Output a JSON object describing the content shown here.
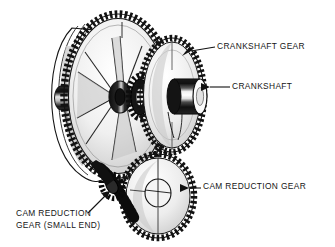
{
  "figure": {
    "style": "black-and-white line art / halftone technical illustration",
    "background_color": "#ffffff",
    "ink_color": "#111111"
  },
  "labels": {
    "crankshaft_gear": "CRANKSHAFT GEAR",
    "crankshaft": "CRANKSHAFT",
    "cam_reduction_gear": "CAM REDUCTION GEAR",
    "cam_reduction_gear_small_end_line1": "CAM REDUCTION",
    "cam_reduction_gear_small_end_line2": "GEAR (SMALL END)"
  },
  "parts": [
    {
      "name": "large-drive-gear",
      "description": "large spoked gear at left, toothed rim"
    },
    {
      "name": "crankshaft-gear",
      "description": "toothed gear at upper right of the drive gear"
    },
    {
      "name": "crankshaft",
      "description": "cylindrical shaft protruding from the crankshaft gear"
    },
    {
      "name": "cam-reduction-gear",
      "description": "large toothed gear at lower right"
    },
    {
      "name": "cam-reduction-gear-small-end",
      "description": "small dark pinion at lower left meshing point"
    },
    {
      "name": "housing-boss",
      "description": "cylindrical stub on the left side of the housing"
    }
  ]
}
